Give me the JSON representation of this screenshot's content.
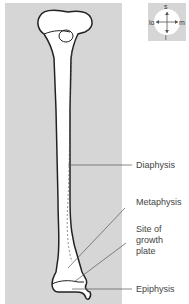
{
  "compass": {
    "top": "s",
    "bottom": "i",
    "left": "lo",
    "right": "m"
  },
  "labels": {
    "diaphysis": "Diaphysis",
    "metaphysis": "Metaphysis",
    "growth_plate": [
      "Site of",
      "growth",
      "plate"
    ],
    "epiphysis": "Epiphysis"
  },
  "colors": {
    "panel": "#d6d6d6",
    "bone": "#ffffff",
    "outline": "#222222",
    "leader": "#555555"
  }
}
